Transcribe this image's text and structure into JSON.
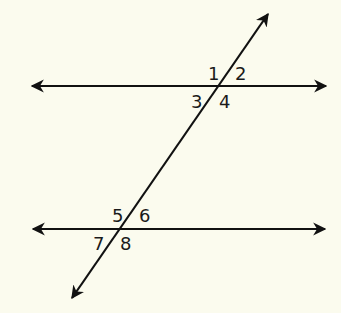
{
  "diagram": {
    "type": "parallel-lines-cut-by-transversal",
    "background_color": "#fbfbee",
    "line_color": "#111111",
    "lines": [
      {
        "name": "top-parallel-line",
        "x1": 32,
        "y1": 86,
        "x2": 326,
        "y2": 86
      },
      {
        "name": "bottom-parallel-line",
        "x1": 33,
        "y1": 229,
        "x2": 325,
        "y2": 229
      },
      {
        "name": "transversal",
        "x1": 268,
        "y1": 14,
        "x2": 72,
        "y2": 298
      }
    ],
    "angle_labels": [
      {
        "label": "1",
        "x": 208,
        "y": 80
      },
      {
        "label": "2",
        "x": 235,
        "y": 80
      },
      {
        "label": "3",
        "x": 191,
        "y": 108
      },
      {
        "label": "4",
        "x": 219,
        "y": 108
      },
      {
        "label": "5",
        "x": 112,
        "y": 222
      },
      {
        "label": "6",
        "x": 139,
        "y": 222
      },
      {
        "label": "7",
        "x": 93,
        "y": 250
      },
      {
        "label": "8",
        "x": 120,
        "y": 250
      }
    ]
  }
}
